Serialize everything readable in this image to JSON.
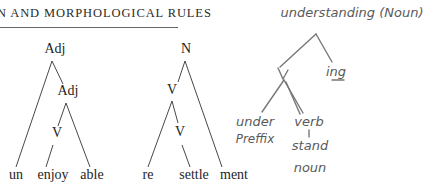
{
  "header": {
    "title": "N AND MORPHOLOGICAL RULES"
  },
  "tree1": {
    "root": "Adj",
    "inner": "Adj",
    "verb": "V",
    "leaves": [
      "un",
      "enjoy",
      "able"
    ]
  },
  "tree2": {
    "root": "N",
    "inner": "V",
    "verb": "V",
    "leaves": [
      "re",
      "settle",
      "ment"
    ]
  },
  "handwritten": {
    "title": "understanding (Noun)",
    "node_v": "V",
    "suffix": "ing",
    "prefix_word": "under",
    "prefix_label": "Preffix",
    "verb_label": "verb",
    "stem_word": "stand",
    "stem_label": "noun"
  }
}
